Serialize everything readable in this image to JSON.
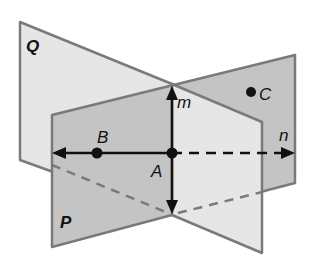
{
  "diagram": {
    "planes": [
      {
        "name": "Q",
        "label": "Q",
        "fill": "#e6e6e6"
      },
      {
        "name": "P",
        "label": "P",
        "fill": "#c4c4c4"
      }
    ],
    "lines": [
      {
        "name": "m",
        "label": "m"
      },
      {
        "name": "n",
        "label": "n"
      }
    ],
    "points": [
      {
        "name": "A",
        "label": "A"
      },
      {
        "name": "B",
        "label": "B"
      },
      {
        "name": "C",
        "label": "C"
      }
    ],
    "colors": {
      "edge": "#7a7a7a",
      "line": "#111111",
      "plane_q": "#e6e6e6",
      "plane_p": "#c4c4c4"
    }
  }
}
